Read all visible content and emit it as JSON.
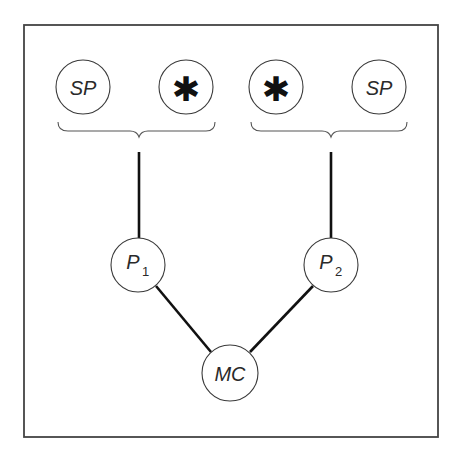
{
  "diagram": {
    "frame": {
      "x": 24,
      "y": 25,
      "width": 414,
      "height": 412,
      "color": "#444444"
    },
    "nodes": {
      "sp_left": {
        "label": "SP",
        "cx": 83,
        "cy": 87,
        "r": 27
      },
      "star_left": {
        "label": "✱",
        "cx": 186,
        "cy": 87,
        "r": 27
      },
      "star_right": {
        "label": "✱",
        "cx": 276,
        "cy": 87,
        "r": 27
      },
      "sp_right": {
        "label": "SP",
        "cx": 379,
        "cy": 87,
        "r": 27
      },
      "p1": {
        "label": "P",
        "subscript": "1",
        "cx": 138,
        "cy": 265,
        "r": 27
      },
      "p2": {
        "label": "P",
        "subscript": "2",
        "cx": 331,
        "cy": 265,
        "r": 27
      },
      "mc": {
        "label": "MC",
        "cx": 230,
        "cy": 373,
        "r": 28
      }
    },
    "groups": [
      {
        "name": "left-group",
        "members": [
          "SP",
          "✱"
        ],
        "parent": "P1"
      },
      {
        "name": "right-group",
        "members": [
          "✱",
          "SP"
        ],
        "parent": "P2"
      }
    ],
    "edges": [
      {
        "from": "left-brace",
        "to": "P1"
      },
      {
        "from": "right-brace",
        "to": "P2"
      },
      {
        "from": "P1",
        "to": "MC"
      },
      {
        "from": "P2",
        "to": "MC"
      }
    ]
  }
}
